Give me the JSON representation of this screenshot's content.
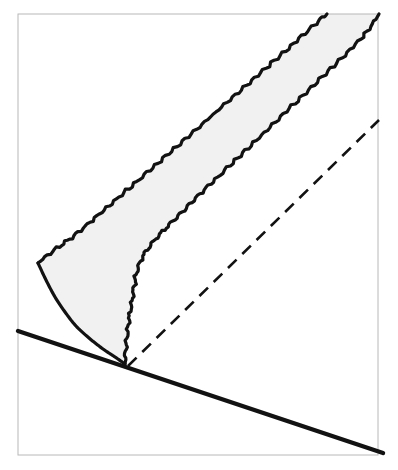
{
  "figure": {
    "title": "",
    "caption": "",
    "background_color": "#ffffff",
    "canvas": {
      "width": 398,
      "height": 470
    },
    "frame": {
      "label": "figure-border",
      "x": 18,
      "y": 14,
      "width": 360,
      "height": 441,
      "stroke_color": "#b8b8b8",
      "stroke_width": 1,
      "fill": "none"
    },
    "ink_color": "#121212",
    "band_fill_color": "#f1f1f1",
    "elements": [
      {
        "name": "shaded-band-region",
        "kind": "filled-region",
        "fill": "#f1f1f1",
        "stroke": "none",
        "description": "Light grey wedge-shaped band widening from the vertex toward the upper right"
      },
      {
        "name": "upper-wavy-boundary",
        "kind": "wavy-curve",
        "stroke": "#121212",
        "stroke_width": 3.2,
        "waviness_amplitude": 1.6,
        "waviness_period": 13,
        "start_point": [
          38,
          263
        ],
        "end_point": [
          327,
          14
        ],
        "description": "Upper crinkled boundary of the shaded band running from the left cusp to the top edge"
      },
      {
        "name": "lower-wavy-boundary",
        "kind": "wavy-curve",
        "stroke": "#121212",
        "stroke_width": 3.2,
        "waviness_amplitude": 1.6,
        "waviness_period": 13,
        "start_point": [
          125,
          364
        ],
        "end_point": [
          379,
          14
        ],
        "description": "Lower crinkled boundary of the shaded band, rising vertically from the vertex then bending to the upper right"
      },
      {
        "name": "smooth-left-curve",
        "kind": "smooth-curve",
        "stroke": "#121212",
        "stroke_width": 3.2,
        "start_point": [
          38,
          263
        ],
        "end_point": [
          125,
          364
        ],
        "description": "Smooth concave curve from the left cusp down to the vertex, closing the shaded region"
      },
      {
        "name": "thick-straight-line",
        "kind": "straight-line",
        "stroke": "#121212",
        "stroke_width": 4.4,
        "start_point": [
          18,
          331
        ],
        "end_point": [
          383,
          453
        ],
        "description": "Heavy straight line descending from the left border through the vertex to the bottom right corner"
      },
      {
        "name": "dashed-reference-line",
        "kind": "dashed-line",
        "stroke": "#121212",
        "stroke_width": 2.6,
        "dash_length": 12,
        "dash_gap": 8,
        "start_point": [
          128,
          366
        ],
        "end_point": [
          379,
          120
        ],
        "description": "Dashed reference ray emanating from the vertex toward the upper right"
      }
    ],
    "vertex_point": [
      125,
      364
    ],
    "cusp_point": [
      38,
      263
    ]
  }
}
